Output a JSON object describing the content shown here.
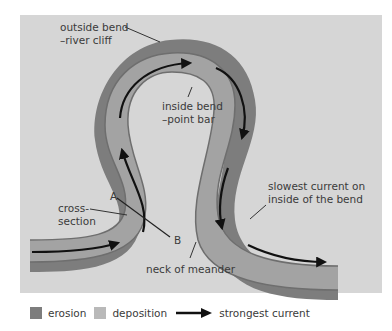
{
  "diagram": {
    "title": "Meander",
    "colors": {
      "background": "#d6d6d6",
      "erosion": "#7d7d7d",
      "deposition": "#b9b9b9",
      "channel": "#9a9a9a",
      "arrow": "#111111"
    },
    "labels": {
      "outside_bend": "outside bend\n–river cliff",
      "inside_bend": "inside bend\n–point bar",
      "cross_section": "cross-\nsection",
      "point_a": "A",
      "point_b": "B",
      "neck": "neck of meander",
      "slowest_current": "slowest current on\ninside of the bend"
    }
  },
  "legend": {
    "items": [
      {
        "label": "erosion",
        "type": "swatch",
        "color": "#7d7d7d"
      },
      {
        "label": "deposition",
        "type": "swatch",
        "color": "#b9b9b9"
      },
      {
        "label": "strongest current",
        "type": "arrow",
        "color": "#111111"
      }
    ]
  }
}
